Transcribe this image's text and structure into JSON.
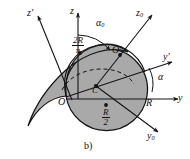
{
  "figure": {
    "caption": "b)",
    "colors": {
      "body_fill": "#a9a9a9",
      "stroke": "#141414",
      "background": "#ffffff",
      "dashed": "#141414"
    },
    "shape": {
      "type": "half-disc-with-crescent",
      "radius_label": "R",
      "description": "shaded semicircular disc of radius R joined to a crescent lobe extending to the upper left"
    }
  },
  "axes": [
    {
      "name": "z-axis",
      "label": "z",
      "sub": "",
      "prime": "",
      "direction": "up"
    },
    {
      "name": "y-axis",
      "label": "y",
      "sub": "",
      "prime": "",
      "direction": "right"
    },
    {
      "name": "z0-axis",
      "label": "z",
      "sub": "0",
      "prime": "",
      "direction": "up-right"
    },
    {
      "name": "y0-axis",
      "label": "y",
      "sub": "0",
      "prime": "",
      "direction": "down-right"
    },
    {
      "name": "z-prime-axis",
      "label": "z",
      "sub": "",
      "prime": "'",
      "direction": "up-left"
    },
    {
      "name": "y-prime-axis",
      "label": "y",
      "sub": "",
      "prime": "'",
      "direction": "right-up"
    }
  ],
  "labels": {
    "z": "z",
    "y": "y",
    "z0_base": "z",
    "z0_sub": "0",
    "y0_base": "y",
    "y0_sub": "0",
    "z_prime": "z'",
    "y_prime": "y'",
    "alpha": "α",
    "alpha0_base": "α",
    "alpha0_sub": "0",
    "origin_O": "O",
    "point_O_prime": "O'",
    "point_C": "C",
    "radius_R": "R"
  },
  "dimensions": [
    {
      "name": "centroid-height",
      "numerator": "2R",
      "denominator": "π"
    },
    {
      "name": "half-radius",
      "numerator": "R",
      "denominator": "2"
    }
  ],
  "angles": [
    {
      "name": "alpha0",
      "symbol": "α",
      "subscript": "0",
      "between": [
        "z-axis",
        "z0-axis"
      ]
    },
    {
      "name": "alpha",
      "symbol": "α",
      "subscript": "",
      "between": [
        "y-prime-axis",
        "y-axis"
      ]
    }
  ]
}
